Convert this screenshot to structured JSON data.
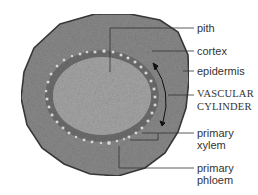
{
  "diagram": {
    "colors": {
      "epidermis_outline": "#3a3a3a",
      "cortex": "#8a8a8a",
      "vascular_ring": "#6e6e6e",
      "pith": "#a6a6a6",
      "bundles": "#d8d8d8",
      "leader_lines": "#333333",
      "label_text": "#333333"
    },
    "labels": [
      {
        "id": "pith",
        "text": "pith"
      },
      {
        "id": "cortex",
        "text": "cortex"
      },
      {
        "id": "epidermis",
        "text": "epidermis"
      },
      {
        "id": "vascular-cylinder",
        "line1": "VASCULAR",
        "line2": "CYLINDER"
      },
      {
        "id": "primary-xylem",
        "line1": "primary",
        "line2": "xylem"
      },
      {
        "id": "primary-phloem",
        "line1": "primary",
        "line2": "phloem"
      }
    ]
  }
}
